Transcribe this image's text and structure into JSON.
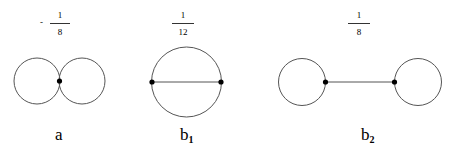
{
  "diagrams": [
    {
      "id": "a",
      "label": "a",
      "subscript": "",
      "coefficient": {
        "sign": "-",
        "numerator": "1",
        "denominator": "8"
      },
      "description": "figure-eight: two tangent loops at one vertex"
    },
    {
      "id": "b1",
      "label": "b",
      "subscript": "1",
      "coefficient": {
        "sign": "",
        "numerator": "1",
        "denominator": "12"
      },
      "description": "circle with a chord connecting two vertices"
    },
    {
      "id": "b2",
      "label": "b",
      "subscript": "2",
      "coefficient": {
        "sign": "",
        "numerator": "1",
        "denominator": "8"
      },
      "description": "two loops joined by a propagator line (dumbbell)"
    }
  ],
  "colors": {
    "line": "#555555",
    "vertex": "#000000",
    "background": "#ffffff"
  }
}
